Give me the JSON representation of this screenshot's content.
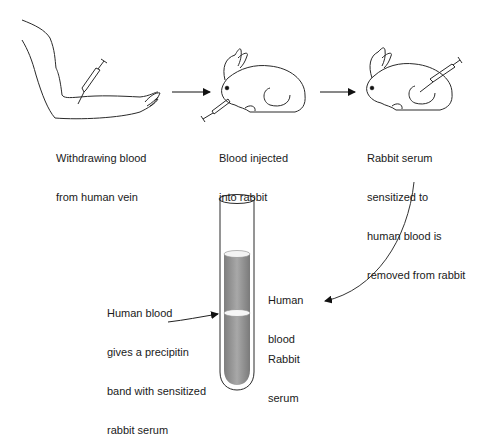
{
  "steps": [
    {
      "caption_lines": [
        "Withdrawing blood",
        "from human vein"
      ]
    },
    {
      "caption_lines": [
        "Blood injected",
        "into rabbit"
      ]
    },
    {
      "caption_lines": [
        "Rabbit serum",
        "sensitized to",
        "human blood is",
        "removed from rabbit"
      ]
    }
  ],
  "tube": {
    "upper_layer_label": [
      "Human",
      "blood"
    ],
    "lower_layer_label": [
      "Rabbit",
      "serum"
    ],
    "band_callout": [
      "Human blood",
      "gives a precipitin",
      "band with sensitized",
      "rabbit serum"
    ]
  },
  "colors": {
    "line": "#2a2a2a",
    "liquid": "#9a9a9a",
    "liquid_top": "#f2f2f2"
  }
}
